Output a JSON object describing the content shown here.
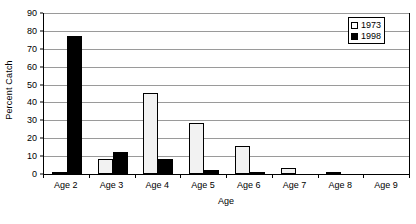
{
  "chart_data": {
    "type": "bar",
    "title": "",
    "xlabel": "Age",
    "ylabel": "Percent Catch",
    "categories": [
      "Age 2",
      "Age 3",
      "Age 4",
      "Age 5",
      "Age 6",
      "Age 7",
      "Age 8",
      "Age 9"
    ],
    "series": [
      {
        "name": "1973",
        "color": "#f2f2f2",
        "values": [
          0.3,
          8.2,
          45.2,
          28.5,
          15.4,
          3.5,
          0.8,
          0
        ]
      },
      {
        "name": "1998",
        "color": "#000000",
        "values": [
          77.2,
          12.4,
          8.4,
          2.1,
          0.9,
          0,
          0,
          0
        ]
      }
    ],
    "ylim": [
      0,
      90
    ],
    "ytick_labels": [
      "0",
      "10",
      "20",
      "30",
      "40",
      "50",
      "60",
      "70",
      "80",
      "90"
    ],
    "ytick_values": [
      0,
      10,
      20,
      30,
      40,
      50,
      60,
      70,
      80,
      90
    ],
    "grid": true,
    "legend_position": "top-right"
  },
  "legend": {
    "entries": [
      {
        "label": "1973",
        "swatch": "hollow-square-icon"
      },
      {
        "label": "1998",
        "swatch": "filled-square-icon"
      }
    ]
  },
  "axes": {
    "y_title": "Percent Catch",
    "x_title": "Age"
  }
}
